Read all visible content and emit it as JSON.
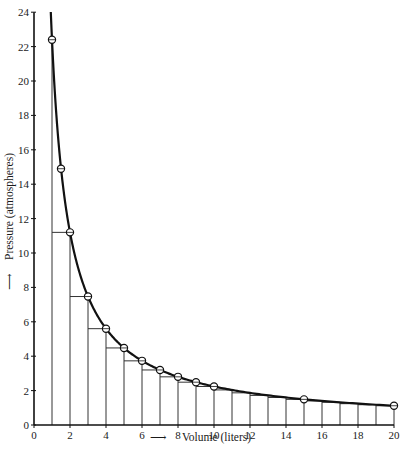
{
  "chart_data": {
    "type": "line",
    "title": "",
    "xlabel": "Volume (liters)",
    "ylabel": "Pressure (atmospheres)",
    "xlabel_arrow": "⟶",
    "ylabel_arrow": "⟶",
    "xlim": [
      0,
      20
    ],
    "ylim": [
      0,
      24
    ],
    "grid": false,
    "legend": null,
    "x_ticks": [
      0,
      2,
      4,
      6,
      8,
      10,
      12,
      14,
      16,
      18,
      20
    ],
    "y_ticks": [
      0,
      2,
      4,
      6,
      8,
      10,
      12,
      14,
      16,
      18,
      20,
      22,
      24
    ],
    "curve": {
      "name": "P = 22.4 / V (Boyle's law isotherm)",
      "constant_PV": 22.4,
      "v_start": 0.933,
      "v_end": 20
    },
    "series": [
      {
        "name": "Measured points",
        "marker": "circle",
        "x": [
          1,
          1.5,
          2,
          3,
          4,
          5,
          6,
          7,
          8,
          9,
          10,
          15,
          20
        ],
        "y": [
          22.4,
          14.9,
          11.2,
          7.47,
          5.6,
          4.48,
          3.73,
          3.2,
          2.8,
          2.49,
          2.24,
          1.49,
          1.12
        ]
      }
    ],
    "rectangles": {
      "description": "Lower step rectangles under the curve at each integer volume",
      "x_left": [
        1,
        2,
        3,
        4,
        5,
        6,
        7,
        8,
        9,
        10,
        11,
        12,
        13,
        14,
        15,
        16,
        17,
        18,
        19
      ],
      "heights": [
        11.2,
        7.47,
        5.6,
        4.48,
        3.73,
        3.2,
        2.8,
        2.49,
        2.24,
        2.04,
        1.87,
        1.72,
        1.6,
        1.49,
        1.4,
        1.32,
        1.24,
        1.18,
        1.12
      ]
    }
  }
}
